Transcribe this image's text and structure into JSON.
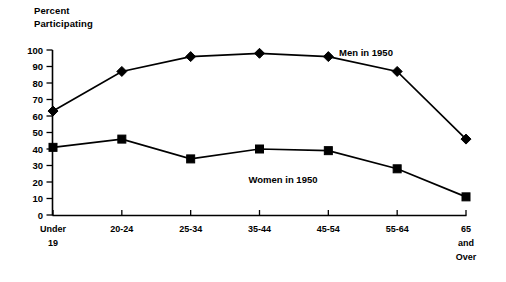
{
  "chart_data": {
    "type": "line",
    "title": "",
    "ylabel": "Percent\nParticipating",
    "xlabel": "",
    "ylim": [
      0,
      100
    ],
    "ytick_step": 10,
    "yticks": [
      0,
      10,
      20,
      30,
      40,
      50,
      60,
      70,
      80,
      90,
      100
    ],
    "grid": false,
    "legend_position": "inline-annotations",
    "categories": [
      "Under 19",
      "20-24",
      "25-34",
      "35-44",
      "45-54",
      "55-64",
      "65 and Over"
    ],
    "category_lines": [
      [
        "Under",
        "19"
      ],
      [
        "20-24"
      ],
      [
        "25-34"
      ],
      [
        "35-44"
      ],
      [
        "45-54"
      ],
      [
        "55-64"
      ],
      [
        "65",
        "and",
        "Over"
      ]
    ],
    "series": [
      {
        "name": "Men in 1950",
        "marker": "diamond",
        "color": "#000000",
        "label_x": 366,
        "label_y": 56,
        "values": [
          63,
          87,
          96,
          98,
          96,
          87,
          46
        ]
      },
      {
        "name": "Women in 1950",
        "marker": "square",
        "color": "#000000",
        "label_x": 283,
        "label_y": 183,
        "values": [
          41,
          46,
          34,
          40,
          39,
          28,
          11
        ]
      }
    ]
  },
  "axes": {
    "y_axis_top_px": 50,
    "y_axis_bottom_px": 215,
    "x_first_px": 53,
    "x_last_px": 466
  }
}
